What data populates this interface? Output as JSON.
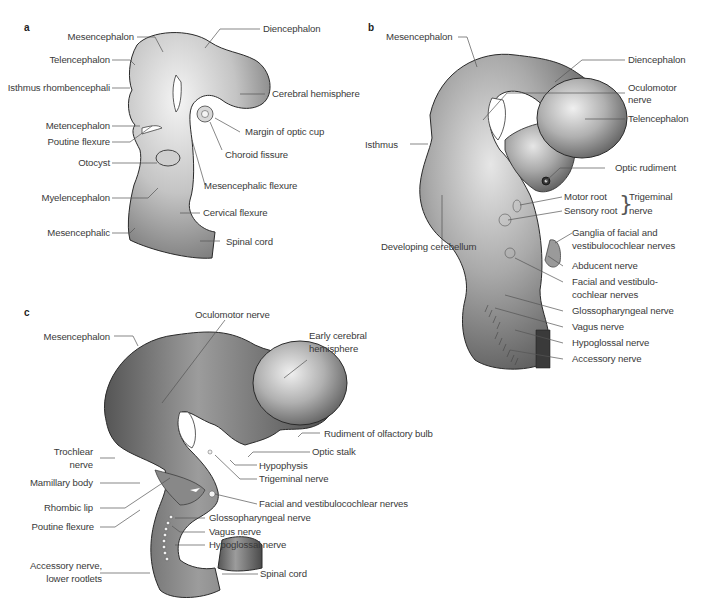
{
  "figure": {
    "panels": [
      {
        "letter": "a",
        "labels": {
          "mesencephalon": "Mesencephalon",
          "telencephalon": "Telencephalon",
          "isthmus": "Isthmus rhombencephali",
          "metencephalon": "Metencephalon",
          "poutine_flexure": "Poutine flexure",
          "otocyst": "Otocyst",
          "myelencephalon": "Myelencephalon",
          "mesencephalic": "Mesencephalic",
          "diencephalon": "Diencephalon",
          "cerebral_hemisphere": "Cerebral hemisphere",
          "margin_optic_cup": "Margin of optic cup",
          "choroid_fissure": "Choroid fissure",
          "mesencephalic_flexure": "Mesencephalic flexure",
          "cervical_flexure": "Cervical flexure",
          "spinal_cord": "Spinal cord"
        }
      },
      {
        "letter": "b",
        "labels": {
          "mesencephalon": "Mesencephalon",
          "diencephalon": "Diencephalon",
          "oculomotor_1": "Oculomotor",
          "oculomotor_2": "nerve",
          "telencephalon": "Telencephalon",
          "isthmus": "Isthmus",
          "optic_rudiment": "Optic rudiment",
          "motor_root": "Motor root",
          "sensory_root": "Sensory root",
          "trigeminal_1": "Trigeminal",
          "trigeminal_2": "nerve",
          "developing_cerebellum": "Developing cerebellum",
          "ganglia_1": "Ganglia of facial and",
          "ganglia_2": "vestibulocochlear nerves",
          "abducent": "Abducent nerve",
          "facial_1": "Facial and vestibulo-",
          "facial_2": "cochlear nerves",
          "glossopharyngeal": "Glossopharyngeal nerve",
          "vagus": "Vagus nerve",
          "hypoglossal": "Hypoglossal nerve",
          "accessory": "Accessory nerve"
        }
      },
      {
        "letter": "c",
        "labels": {
          "mesencephalon": "Mesencephalon",
          "oculomotor": "Oculomotor nerve",
          "early_cerebral_1": "Early cerebral",
          "early_cerebral_2": "hemisphere",
          "rudiment_olfactory": "Rudiment of olfactory bulb",
          "optic_stalk": "Optic stalk",
          "hypophysis": "Hypophysis",
          "trigeminal": "Trigeminal nerve",
          "trochlear_1": "Trochlear",
          "trochlear_2": "nerve",
          "mamillary": "Mamillary body",
          "rhombic_lip": "Rhombic lip",
          "poutine_flexure": "Poutine flexure",
          "facial_vestibulocochlear": "Facial and vestibulocochlear nerves",
          "glossopharyngeal": "Glossopharyngeal nerve",
          "vagus": "Vagus nerve",
          "hypoglossal": "Hypoglossal nerve",
          "accessory_1": "Accessory nerve,",
          "accessory_2": "lower rootlets",
          "spinal_cord": "Spinal cord"
        }
      }
    ],
    "colors": {
      "background": "#ffffff",
      "tissue_light": "#e8e8e8",
      "tissue_mid": "#a8a8a8",
      "tissue_dark": "#5a5a5a",
      "outline": "#2a2a2a",
      "leader_line": "#555555",
      "text": "#3a3a3a"
    }
  }
}
